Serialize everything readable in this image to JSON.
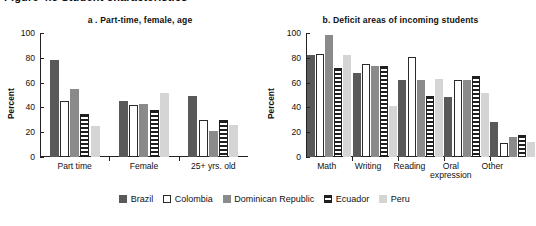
{
  "cut_off_header": "Figure 4.5  Student characteristics",
  "legend": {
    "position": "bottom",
    "items": [
      {
        "label": "Brazil",
        "key": "brazil",
        "color": "#595959"
      },
      {
        "label": "Colombia",
        "key": "colombia",
        "color": "#ffffff"
      },
      {
        "label": "Dominican Republic",
        "key": "dominican",
        "color": "#8a8a8a"
      },
      {
        "label": "Ecuador",
        "key": "ecuador",
        "color": "#ffffff"
      },
      {
        "label": "Peru",
        "key": "peru",
        "color": "#d5d5d5"
      }
    ]
  },
  "chart_data": [
    {
      "type": "bar",
      "id": "a",
      "title": "a . Part-time, female, age",
      "xlabel": "",
      "ylabel": "Percent",
      "ylim": [
        0,
        100
      ],
      "yticks": [
        0,
        20,
        40,
        60,
        80,
        100
      ],
      "grid": false,
      "categories": [
        "Part time",
        "Female",
        "25+ yrs. old"
      ],
      "series": [
        {
          "name": "Brazil",
          "values": [
            78,
            45,
            49
          ]
        },
        {
          "name": "Colombia",
          "values": [
            45,
            42,
            30
          ]
        },
        {
          "name": "Dominican Republic",
          "values": [
            55,
            43,
            21
          ]
        },
        {
          "name": "Ecuador",
          "values": [
            35,
            38,
            30
          ]
        },
        {
          "name": "Peru",
          "values": [
            25,
            52,
            26
          ]
        }
      ]
    },
    {
      "type": "bar",
      "id": "b",
      "title": "b. Deficit areas of incoming students",
      "xlabel": "",
      "ylabel": "Percent",
      "ylim": [
        0,
        100
      ],
      "yticks": [
        0,
        20,
        40,
        60,
        80,
        100
      ],
      "grid": false,
      "categories": [
        "Math",
        "Writing",
        "Reading",
        "Oral expression",
        "Other"
      ],
      "series": [
        {
          "name": "Brazil",
          "values": [
            82,
            68,
            62,
            48,
            28
          ]
        },
        {
          "name": "Colombia",
          "values": [
            83,
            75,
            81,
            62,
            11
          ]
        },
        {
          "name": "Dominican Republic",
          "values": [
            98,
            73,
            62,
            62,
            16
          ]
        },
        {
          "name": "Ecuador",
          "values": [
            72,
            73,
            49,
            65,
            18
          ]
        },
        {
          "name": "Peru",
          "values": [
            82,
            41,
            63,
            52,
            12
          ]
        }
      ]
    }
  ]
}
